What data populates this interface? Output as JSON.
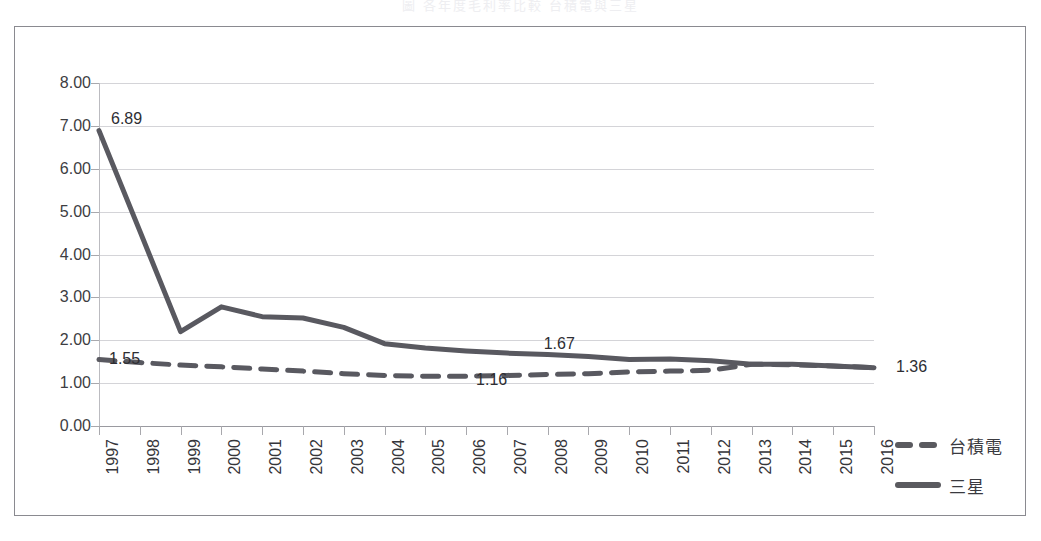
{
  "caption": {
    "text": "圖     各年度毛利率比較    台積電與三星"
  },
  "chart_data": {
    "type": "line",
    "title": "",
    "subtitle": "",
    "xlabel": "",
    "ylabel": "",
    "categories": [
      "1997",
      "1998",
      "1999",
      "2000",
      "2001",
      "2002",
      "2003",
      "2004",
      "2005",
      "2006",
      "2007",
      "2008",
      "2009",
      "2010",
      "2011",
      "2012",
      "2013",
      "2014",
      "2015",
      "2016"
    ],
    "ylim": [
      0,
      8
    ],
    "ytick_values": [
      0,
      1,
      2,
      3,
      4,
      5,
      6,
      7,
      8
    ],
    "ytick_labels": [
      "0.00",
      "1.00",
      "2.00",
      "3.00",
      "4.00",
      "5.00",
      "6.00",
      "7.00",
      "8.00"
    ],
    "grid": true,
    "legend_position": "right",
    "series": [
      {
        "name": "台積電",
        "style": "dashed",
        "color": "#595960",
        "values": [
          1.55,
          1.48,
          1.42,
          1.38,
          1.33,
          1.28,
          1.22,
          1.18,
          1.16,
          1.16,
          1.18,
          1.2,
          1.22,
          1.26,
          1.28,
          1.3,
          1.44,
          1.43,
          1.4,
          1.36
        ]
      },
      {
        "name": "三星",
        "style": "solid",
        "color": "#595960",
        "values": [
          6.89,
          4.55,
          2.2,
          2.78,
          2.55,
          2.52,
          2.3,
          1.92,
          1.82,
          1.75,
          1.7,
          1.67,
          1.62,
          1.55,
          1.56,
          1.52,
          1.44,
          1.44,
          1.4,
          1.36
        ]
      }
    ],
    "data_labels": [
      {
        "text": "6.89",
        "series": "三星",
        "category": "1997",
        "value": 6.89
      },
      {
        "text": "1.55",
        "series": "台積電",
        "category": "1997",
        "value": 1.55
      },
      {
        "text": "1.16",
        "series": "台積電",
        "category": "2006",
        "value": 1.16
      },
      {
        "text": "1.67",
        "series": "三星",
        "category": "2008",
        "value": 1.67
      },
      {
        "text": "1.36",
        "series": "三星",
        "category": "2016",
        "value": 1.36
      }
    ]
  },
  "legend": {
    "items": [
      {
        "label": "台積電",
        "style": "dashed"
      },
      {
        "label": "三星",
        "style": "solid"
      }
    ]
  },
  "colors": {
    "line": "#595960",
    "grid": "#d4d4d8",
    "axis": "#9a9aa0",
    "frame": "#8a8a90",
    "text": "#35353a",
    "background": "#ffffff"
  }
}
